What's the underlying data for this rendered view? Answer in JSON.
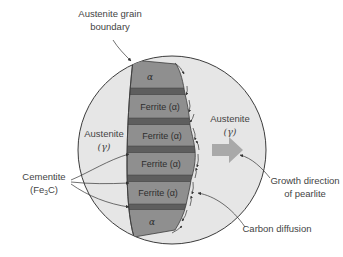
{
  "diagram": {
    "labels": {
      "grain_boundary_line1": "Austenite grain",
      "grain_boundary_line2": "boundary",
      "austenite_left_line1": "Austenite",
      "austenite_left_line2": "(γ)",
      "austenite_right_line1": "Austenite",
      "austenite_right_line2": "(γ)",
      "cementite_line1": "Cementite",
      "cementite_line2": "(Fe",
      "cementite_sub": "3",
      "cementite_line2_end": "C)",
      "growth_line1": "Growth direction",
      "growth_line2": "of pearlite",
      "carbon_diffusion": "Carbon diffusion"
    },
    "layers": [
      {
        "type": "alpha",
        "label": "α"
      },
      {
        "type": "cementite",
        "label": ""
      },
      {
        "type": "ferrite",
        "label": "Ferrite (α)"
      },
      {
        "type": "cementite",
        "label": ""
      },
      {
        "type": "ferrite",
        "label": "Ferrite (α)"
      },
      {
        "type": "cementite",
        "label": ""
      },
      {
        "type": "ferrite",
        "label": "Ferrite (α)"
      },
      {
        "type": "cementite",
        "label": ""
      },
      {
        "type": "ferrite",
        "label": "Ferrite (α)"
      },
      {
        "type": "cementite",
        "label": ""
      },
      {
        "type": "alpha",
        "label": "α"
      }
    ],
    "colors": {
      "austenite": "#e6e6e6",
      "ferrite": "#8f8f8f",
      "cementite": "#5e5e5e",
      "outline": "#3c3c3c",
      "growth_arrow": "#a9a9a9",
      "text": "#444444"
    }
  }
}
